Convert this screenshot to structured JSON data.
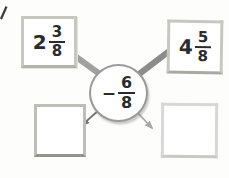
{
  "figure": {
    "operation": {
      "sign": "−",
      "numerator": "6",
      "denominator": "8"
    },
    "inputs": [
      {
        "whole": "2",
        "numerator": "3",
        "denominator": "8"
      },
      {
        "whole": "4",
        "numerator": "5",
        "denominator": "8"
      }
    ],
    "outputs": [
      {
        "value": ""
      },
      {
        "value": ""
      }
    ],
    "colors": {
      "line_left": "#a0a0a0",
      "line_right": "#8c8c8c",
      "arrow_left": "#757575",
      "arrow_right": "#a8a8a8",
      "text": "#2b2b2b"
    }
  }
}
